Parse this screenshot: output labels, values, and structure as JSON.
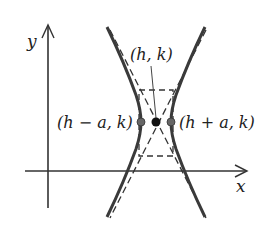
{
  "diagram": {
    "axes": {
      "x_label": "x",
      "y_label": "y"
    },
    "labels": {
      "center": "(h, k)",
      "left_vertex": "(h − a, k)",
      "right_vertex": "(h + a, k)"
    },
    "colors": {
      "curve": "#3a3a3a",
      "axis": "#333333",
      "dashed": "#333333",
      "vertex_dot": "#666666",
      "center_dot": "#111111",
      "background": "#ffffff"
    },
    "elements": [
      "hyperbola-left-branch",
      "hyperbola-right-branch",
      "asymptote-dashed-lines",
      "fundamental-rectangle-dashed",
      "center-point",
      "left-vertex-point",
      "right-vertex-point"
    ]
  }
}
